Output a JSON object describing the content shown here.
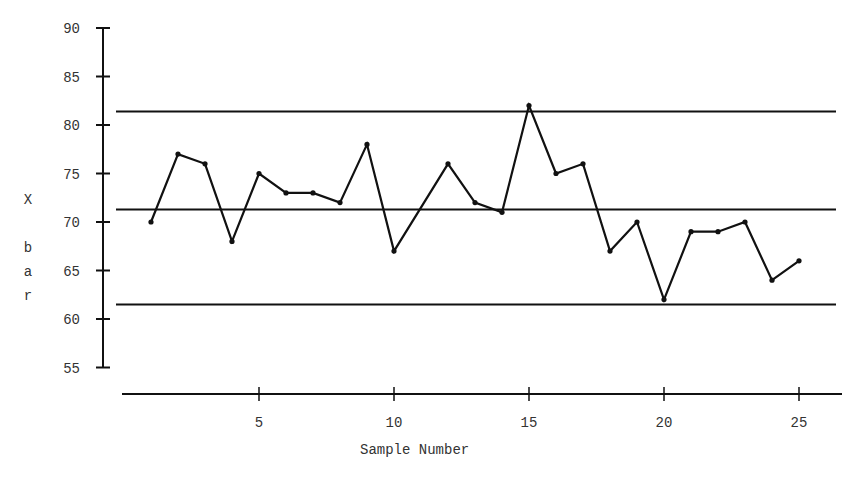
{
  "chart_data": {
    "type": "line",
    "title": "",
    "xlabel": "Sample Number",
    "ylabel": "X bar",
    "ylabel_letters": [
      "X",
      "",
      "b",
      "a",
      "r"
    ],
    "x": [
      1,
      2,
      3,
      4,
      5,
      6,
      7,
      8,
      9,
      10,
      11,
      12,
      13,
      14,
      15,
      16,
      17,
      18,
      19,
      20,
      21,
      22,
      23,
      24,
      25
    ],
    "series": [
      {
        "name": "X bar",
        "values": [
          70,
          77,
          76,
          68,
          75,
          73,
          73,
          72,
          78,
          67,
          null,
          76,
          72,
          71,
          82,
          75,
          76,
          67,
          70,
          62,
          69,
          69,
          70,
          64,
          66
        ]
      }
    ],
    "control_limits": {
      "ucl": 81.4,
      "center": 71.3,
      "lcl": 61.5
    },
    "xticks": [
      5,
      10,
      15,
      20,
      25
    ],
    "yticks": [
      55,
      60,
      65,
      70,
      75,
      80,
      85,
      90
    ],
    "xlim": [
      0,
      26
    ],
    "ylim": [
      55,
      90
    ],
    "grid": false,
    "legend": null,
    "colors": {
      "line": "#111111",
      "axis": "#111111"
    }
  }
}
